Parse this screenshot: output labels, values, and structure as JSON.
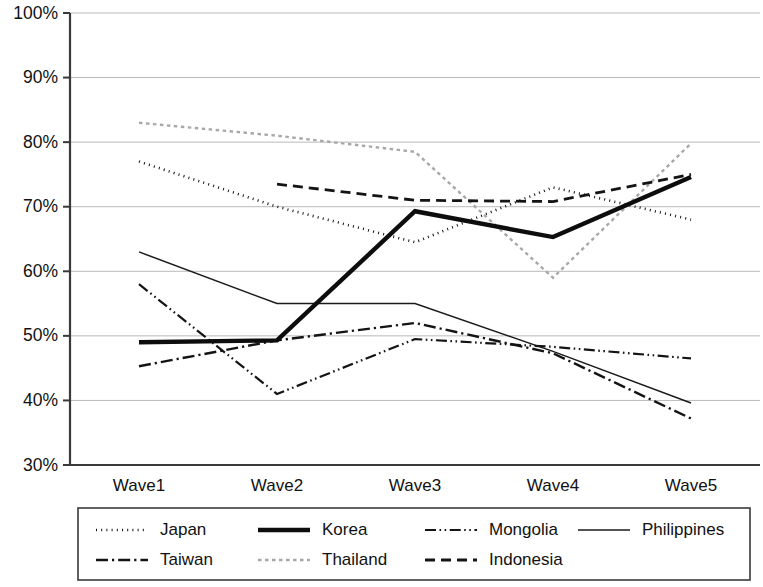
{
  "chart_data": {
    "type": "line",
    "title": "",
    "xlabel": "",
    "ylabel": "",
    "categories": [
      "Wave1",
      "Wave2",
      "Wave3",
      "Wave4",
      "Wave5"
    ],
    "ylim": [
      30,
      100
    ],
    "ytick_labels": [
      "30%",
      "40%",
      "50%",
      "60%",
      "70%",
      "80%",
      "90%",
      "100%"
    ],
    "ytick_values": [
      30,
      40,
      50,
      60,
      70,
      80,
      90,
      100
    ],
    "grid": true,
    "legend_position": "bottom",
    "units": "percent",
    "series": [
      {
        "name": "Japan",
        "style": "dotted",
        "color": "#141414",
        "width": 2.6,
        "dash": "1,4.2",
        "values": [
          77,
          70,
          64.5,
          73,
          68
        ]
      },
      {
        "name": "Korea",
        "style": "solid-thick",
        "color": "#0d0d0d",
        "width": 4.4,
        "dash": "",
        "values": [
          49,
          49.3,
          69.3,
          65.3,
          74.6
        ]
      },
      {
        "name": "Mongolia",
        "style": "dash-dot-dot",
        "color": "#141414",
        "width": 2.2,
        "dash": "11,3.5,1.6,3.5,1.6,3.5",
        "values": [
          58,
          41,
          49.5,
          48.3,
          46.5
        ]
      },
      {
        "name": "Philippines",
        "style": "solid-thin",
        "color": "#1a1a1a",
        "width": 1.5,
        "dash": "",
        "values": [
          63,
          55,
          55,
          47.6,
          39.6
        ]
      },
      {
        "name": "Taiwan",
        "style": "dash-dot",
        "color": "#141414",
        "width": 2.4,
        "dash": "12,4,2.2,4",
        "values": [
          45.3,
          49.3,
          52,
          47.3,
          37.2
        ]
      },
      {
        "name": "Thailand",
        "style": "dotted-light",
        "color": "#a8a8a8",
        "width": 2.4,
        "dash": "3.5,3.5",
        "values": [
          83,
          81,
          78.5,
          59,
          79.8
        ]
      },
      {
        "name": "Indonesia",
        "style": "dashed",
        "color": "#141414",
        "width": 2.8,
        "dash": "10,6",
        "values": [
          null,
          73.5,
          71,
          70.8,
          75
        ]
      }
    ],
    "legend_entries": [
      {
        "label": "Japan",
        "row": 0,
        "col": 0
      },
      {
        "label": "Korea",
        "row": 0,
        "col": 1
      },
      {
        "label": "Mongolia",
        "row": 0,
        "col": 2
      },
      {
        "label": "Philippines",
        "row": 0,
        "col": 3
      },
      {
        "label": "Taiwan",
        "row": 1,
        "col": 0
      },
      {
        "label": "Thailand",
        "row": 1,
        "col": 1
      },
      {
        "label": "Indonesia",
        "row": 1,
        "col": 2
      }
    ]
  }
}
